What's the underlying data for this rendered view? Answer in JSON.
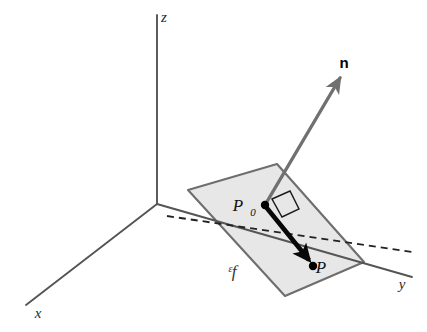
{
  "figure": {
    "type": "3d-geometry-diagram",
    "width": 427,
    "height": 332,
    "background_color": "#ffffff"
  },
  "axes": {
    "origin": {
      "x": 157,
      "y": 204
    },
    "items": [
      {
        "name": "z",
        "label": "z",
        "label_x": 164,
        "label_y": 22,
        "line": {
          "x1": 157,
          "y1": 204,
          "x2": 157,
          "y2": 15
        },
        "color": "#555555"
      },
      {
        "name": "x",
        "label": "x",
        "label_x": 38,
        "label_y": 318,
        "line": {
          "x1": 157,
          "y1": 204,
          "x2": 26,
          "y2": 305
        },
        "color": "#555555"
      },
      {
        "name": "y",
        "label": "y",
        "label_x": 402,
        "label_y": 289,
        "line": {
          "x1": 157,
          "y1": 204,
          "x2": 412,
          "y2": 277
        },
        "color": "#555555"
      }
    ]
  },
  "plane": {
    "label": "ᵋf",
    "label_text": "P",
    "label_x": 232,
    "label_y": 277,
    "fill_color": "#e7e7e7",
    "stroke_color": "#6e6e6e",
    "corners": [
      {
        "x": 188,
        "y": 190
      },
      {
        "x": 277,
        "y": 164
      },
      {
        "x": 364,
        "y": 262
      },
      {
        "x": 285,
        "y": 296
      }
    ]
  },
  "dashed_line": {
    "name": "plane-axis-intersection",
    "x1": 167,
    "y1": 216,
    "x2": 412,
    "y2": 252,
    "color": "#222222",
    "dash": "7 5"
  },
  "points": [
    {
      "name": "P0",
      "label": "P",
      "subscript": "0",
      "x": 265,
      "y": 205,
      "label_x": 238,
      "label_y": 211,
      "sub_x": 253,
      "sub_y": 216,
      "dot_radius": 4.2,
      "color": "#000000"
    },
    {
      "name": "P",
      "label": "P",
      "subscript": "",
      "x": 313,
      "y": 266,
      "label_x": 321,
      "label_y": 273,
      "dot_radius": 4.2,
      "color": "#000000"
    }
  ],
  "normal_vector": {
    "name": "n",
    "label": "n",
    "label_x": 344,
    "label_y": 68,
    "from": {
      "x": 265,
      "y": 205
    },
    "to": {
      "x": 340,
      "y": 78
    },
    "color": "#707070",
    "stroke_width": 3.4
  },
  "plane_vector": {
    "name": "P0-to-P",
    "from": {
      "x": 266,
      "y": 207
    },
    "to": {
      "x": 309,
      "y": 260
    },
    "color": "#080808",
    "stroke_width": 4.6
  },
  "right_angle_marker": {
    "name": "right-angle-at-P0",
    "color": "#1a1a1a",
    "points": "272,199 290,191 299,209 282,217",
    "stroke_width": 1.4
  }
}
